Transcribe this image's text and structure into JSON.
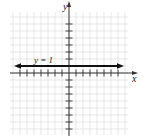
{
  "chart_data": {
    "type": "line",
    "title": "",
    "xlabel": "x",
    "ylabel": "y",
    "xlim": [
      -8,
      8
    ],
    "ylim": [
      -9,
      8
    ],
    "grid": true,
    "series": [
      {
        "name": "y = 1",
        "equation": "y = 1",
        "x": [
          -8,
          8
        ],
        "values": [
          1,
          1
        ],
        "arrows": "both"
      }
    ],
    "annotations": [
      {
        "text": "y = 1",
        "x": -5,
        "y": 1.3
      }
    ],
    "x_ticks_per_side": 7,
    "y_ticks_up": 7,
    "y_ticks_down": 8
  },
  "labels": {
    "x_axis": "x",
    "y_axis": "y",
    "line": "y = 1"
  },
  "colors": {
    "grid": "#d8d8d8",
    "axis": "#333333",
    "line": "#111111"
  }
}
